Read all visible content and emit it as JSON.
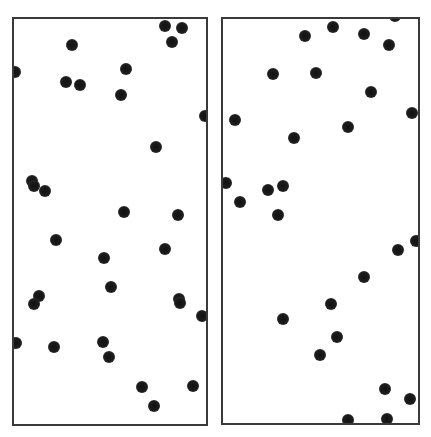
{
  "diagram": {
    "type": "particle-distribution",
    "panels": [
      {
        "name": "left",
        "box": {
          "x": 12,
          "y": 17,
          "w": 196,
          "h": 409
        },
        "particles": [
          [
            165,
            26
          ],
          [
            182,
            28
          ],
          [
            172,
            42
          ],
          [
            72,
            45
          ],
          [
            15,
            72
          ],
          [
            126,
            69
          ],
          [
            66,
            82
          ],
          [
            80,
            85
          ],
          [
            121,
            95
          ],
          [
            205,
            116
          ],
          [
            156,
            147
          ],
          [
            32,
            181
          ],
          [
            34,
            186
          ],
          [
            45,
            191
          ],
          [
            124,
            212
          ],
          [
            178,
            215
          ],
          [
            56,
            240
          ],
          [
            104,
            258
          ],
          [
            165,
            249
          ],
          [
            111,
            287
          ],
          [
            39,
            296
          ],
          [
            34,
            304
          ],
          [
            179,
            299
          ],
          [
            180,
            303
          ],
          [
            202,
            316
          ],
          [
            16,
            343
          ],
          [
            54,
            347
          ],
          [
            103,
            342
          ],
          [
            109,
            357
          ],
          [
            142,
            387
          ],
          [
            193,
            386
          ],
          [
            154,
            406
          ]
        ]
      },
      {
        "name": "right",
        "box": {
          "x": 221,
          "y": 17,
          "w": 199,
          "h": 408
        },
        "particles": [
          [
            395,
            16
          ],
          [
            333,
            27
          ],
          [
            305,
            36
          ],
          [
            364,
            34
          ],
          [
            389,
            45
          ],
          [
            273,
            74
          ],
          [
            316,
            73
          ],
          [
            371,
            92
          ],
          [
            412,
            113
          ],
          [
            235,
            120
          ],
          [
            348,
            127
          ],
          [
            294,
            138
          ],
          [
            226,
            183
          ],
          [
            268,
            190
          ],
          [
            283,
            186
          ],
          [
            240,
            202
          ],
          [
            278,
            215
          ],
          [
            416,
            241
          ],
          [
            398,
            250
          ],
          [
            364,
            277
          ],
          [
            331,
            304
          ],
          [
            283,
            319
          ],
          [
            337,
            337
          ],
          [
            320,
            355
          ],
          [
            385,
            389
          ],
          [
            410,
            399
          ],
          [
            348,
            420
          ],
          [
            387,
            419
          ]
        ]
      }
    ],
    "colors": {
      "particle": "#1a1a1a",
      "border": "#3a3a3a",
      "background": "#ffffff"
    }
  }
}
